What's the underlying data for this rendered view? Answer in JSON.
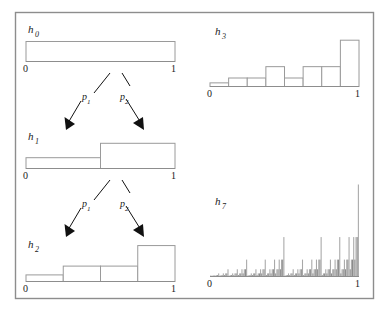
{
  "figure": {
    "frame_color": "#888888",
    "background_color": "#ffffff",
    "bar_stroke_color": "#9a9a9a",
    "bar_fill_color": "#ffffff",
    "cascade_fill_color": "#a8a8a8",
    "cascade_fill_color_dark": "#8a8a8a",
    "arrow_color": "#111111",
    "text_color": "#1a1a1a"
  },
  "panels": {
    "h0": {
      "label": "h",
      "subscript": "0",
      "axis_min_label": "0",
      "axis_max_label": "1"
    },
    "h1": {
      "label": "h",
      "subscript": "1",
      "axis_min_label": "0",
      "axis_max_label": "1"
    },
    "h2": {
      "label": "h",
      "subscript": "2",
      "axis_min_label": "0",
      "axis_max_label": "1"
    },
    "h3": {
      "label": "h",
      "subscript": "3",
      "axis_min_label": "0",
      "axis_max_label": "1"
    },
    "h7": {
      "label": "h",
      "subscript": "7",
      "axis_min_label": "0",
      "axis_max_label": "1"
    }
  },
  "arrows": {
    "group_1": {
      "left_label": "p",
      "left_subscript": "1",
      "right_label": "p",
      "right_subscript": "2"
    },
    "group_2": {
      "left_label": "p",
      "left_subscript": "1",
      "right_label": "p",
      "right_subscript": "2"
    }
  },
  "chart_data": [
    {
      "type": "bar",
      "name": "h0",
      "title": "h_0",
      "stage": 0,
      "n_bins": 1,
      "categories": [
        "[0,1]"
      ],
      "values": [
        1.0
      ],
      "xlabel": "",
      "ylabel": "",
      "xlim": [
        0,
        1
      ],
      "ylim": [
        0,
        1.0
      ],
      "tick_labels": [
        "0",
        "1"
      ],
      "grid": false,
      "legend": "none"
    },
    {
      "type": "bar",
      "name": "h1",
      "title": "h_1",
      "stage": 1,
      "n_bins": 2,
      "p1": 0.3,
      "p2": 0.7,
      "categories": [
        "[0,0.5]",
        "[0.5,1]"
      ],
      "values": [
        0.3,
        0.7
      ],
      "xlabel": "",
      "ylabel": "",
      "xlim": [
        0,
        1
      ],
      "ylim": [
        0,
        1.0
      ],
      "tick_labels": [
        "0",
        "1"
      ],
      "grid": false,
      "legend": "none"
    },
    {
      "type": "bar",
      "name": "h2",
      "title": "h_2",
      "stage": 2,
      "n_bins": 4,
      "p1": 0.3,
      "p2": 0.7,
      "categories": [
        "[0,.25]",
        "[.25,.5]",
        "[.5,.75]",
        "[.75,1]"
      ],
      "values": [
        0.09,
        0.21,
        0.21,
        0.49
      ],
      "xlabel": "",
      "ylabel": "",
      "xlim": [
        0,
        1
      ],
      "ylim": [
        0,
        0.6
      ],
      "tick_labels": [
        "0",
        "1"
      ],
      "grid": false,
      "legend": "none"
    },
    {
      "type": "bar",
      "name": "h3",
      "title": "h_3",
      "stage": 3,
      "n_bins": 8,
      "p1": 0.3,
      "p2": 0.7,
      "categories": [
        "b0",
        "b1",
        "b2",
        "b3",
        "b4",
        "b5",
        "b6",
        "b7"
      ],
      "values": [
        0.027,
        0.063,
        0.063,
        0.147,
        0.063,
        0.147,
        0.147,
        0.343
      ],
      "xlabel": "",
      "ylabel": "",
      "xlim": [
        0,
        1
      ],
      "ylim": [
        0,
        0.4
      ],
      "tick_labels": [
        "0",
        "1"
      ],
      "grid": false,
      "legend": "none"
    },
    {
      "type": "bar",
      "name": "h7",
      "title": "h_7",
      "stage": 7,
      "n_bins": 128,
      "p1": 0.3,
      "p2": 0.7,
      "note": "Multiplicative cascade measure: value of bin i = product over 7 binary digits of i of p1 (bit 0) and p2 (bit 1)",
      "xlabel": "",
      "ylabel": "",
      "xlim": [
        0,
        1
      ],
      "ylim": [
        0,
        0.0824
      ],
      "tick_labels": [
        "0",
        "1"
      ],
      "grid": false,
      "legend": "none"
    }
  ]
}
